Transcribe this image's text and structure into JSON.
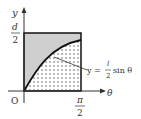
{
  "diagram": {
    "axes": {
      "x_label": "θ",
      "y_label": "y",
      "origin_label": "O"
    },
    "ticks": {
      "y_top": {
        "num": "d",
        "den": "2"
      },
      "x_right": {
        "num": "π",
        "den": "2"
      }
    },
    "curve_label": {
      "prefix": "y =",
      "frac_num": "l",
      "frac_den": "2",
      "suffix": "sin θ"
    },
    "colors": {
      "upper_region": "#cfcfcf",
      "lower_region_dots": "#9a9a9a",
      "stroke": "#111111"
    }
  }
}
